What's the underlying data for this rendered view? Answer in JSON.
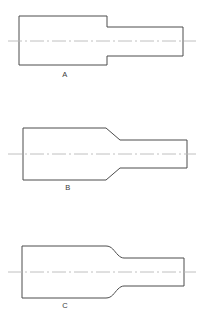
{
  "drawing": {
    "title": "Stepped Shaft Transition Types",
    "background_color": "#ffffff",
    "line_color": "#4c4c4c",
    "centerline_color": "#b9b9b9",
    "label_color": "#3a3a3a",
    "figures": [
      {
        "id": "A",
        "label": "A",
        "transition_type": "square-shoulder",
        "description": "Large diameter section joined to small diameter section by an abrupt square shoulder",
        "label_x": 65,
        "label_y": 77,
        "centerline": {
          "x1": 8,
          "x2": 196,
          "y": 41
        },
        "profile": {
          "large_left": 19,
          "large_right": 107,
          "large_top": 16,
          "large_bottom": 65,
          "small_right": 183,
          "small_top": 27,
          "small_bottom": 56
        },
        "path": "M 19 16 L 107 16 L 107 27 L 183 27 L 183 56 L 107 56 L 107 65 L 19 65 Z"
      },
      {
        "id": "B",
        "label": "B",
        "transition_type": "chamfer-taper",
        "description": "Large diameter section joined to small diameter section by an angled chamfer taper",
        "label_x": 68,
        "label_y": 190,
        "centerline": {
          "x1": 8,
          "x2": 196,
          "y": 154
        },
        "profile": {
          "large_left": 23,
          "large_right": 106,
          "large_top": 128,
          "large_bottom": 180,
          "taper_end": 120,
          "small_right": 187,
          "small_top": 140,
          "small_bottom": 168
        },
        "path": "M 23 128 L 106 128 L 120 140 L 187 140 L 187 168 L 120 168 L 106 180 L 23 180 Z"
      },
      {
        "id": "C",
        "label": "C",
        "transition_type": "fillet-radius",
        "description": "Large diameter section joined to small diameter section by a concave fillet radius blend",
        "label_x": 65,
        "label_y": 308,
        "centerline": {
          "x1": 8,
          "x2": 196,
          "y": 272
        },
        "profile": {
          "large_left": 22,
          "large_right": 106,
          "large_top": 246,
          "large_bottom": 298,
          "fillet_end": 124,
          "small_right": 184,
          "small_top": 258,
          "small_bottom": 286
        },
        "path": "M 22 246 L 106 246 C 112 246 114 251 118 255 C 120 257 122 258 124 258 L 184 258 L 184 286 L 124 286 C 122 286 120 287 118 289 C 114 293 112 298 106 298 L 22 298 Z"
      }
    ]
  }
}
